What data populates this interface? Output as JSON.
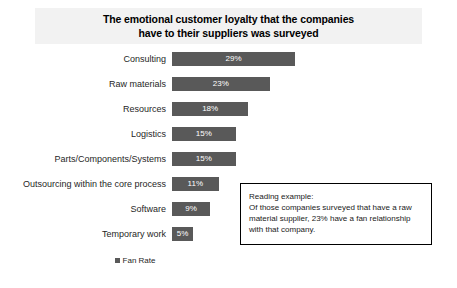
{
  "chart_data": {
    "type": "bar",
    "orientation": "horizontal",
    "title": "The emotional customer loyalty that the companies\nhave to their suppliers was surveyed",
    "xlabel": "",
    "ylabel": "",
    "categories": [
      "Consulting",
      "Raw materials",
      "Resources",
      "Logistics",
      "Parts/Components/Systems",
      "Outsourcing within the core process",
      "Software",
      "Temporary work"
    ],
    "values": [
      29,
      23,
      18,
      15,
      15,
      11,
      9,
      5
    ],
    "value_labels": [
      "29%",
      "23%",
      "18%",
      "15%",
      "15%",
      "11%",
      "9%",
      "5%"
    ],
    "series": [
      {
        "name": "Fan Rate",
        "values": [
          29,
          23,
          18,
          15,
          15,
          11,
          9,
          5
        ]
      }
    ],
    "xlim": [
      0,
      29
    ],
    "grid": false,
    "legend_position": "bottom",
    "bar_color": "#595959"
  },
  "legend": {
    "label": "Fan Rate"
  },
  "annotation": {
    "text": "Reading example:\nOf those companies surveyed that have a raw\nmaterial supplier, 23% have a fan relationship\nwith that company."
  },
  "colors": {
    "bar": "#595959",
    "title_band": "#f2f2f2",
    "text": "#262626",
    "box_border": "#000000"
  }
}
